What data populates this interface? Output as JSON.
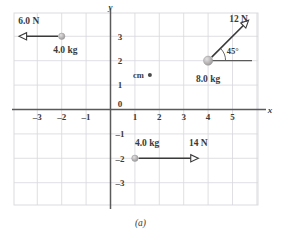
{
  "figure": {
    "caption": "(a)",
    "axes": {
      "x_axis_label": "x",
      "y_axis_label": "y",
      "x_ticks": [
        "-3",
        "-2",
        "-1",
        "1",
        "2",
        "3",
        "4",
        "5"
      ],
      "y_ticks": [
        "3",
        "2",
        "1",
        "-1",
        "-2",
        "-3"
      ],
      "origin_label": "0",
      "x_range": [
        -3.7,
        5.8
      ],
      "y_range": [
        -3.7,
        3.7
      ],
      "grid": true,
      "grid_color": "#d8d8dd",
      "axis_color": "#5a5a5a"
    },
    "center_of_mass": {
      "label": "cm",
      "x": 1.45,
      "y": 1.4,
      "marker": "dot"
    },
    "particles": [
      {
        "id": "particle-top-left",
        "mass_label": "4.0 kg",
        "x": -2.0,
        "y": 3.0,
        "radius": 3.2,
        "color": "#b0aeae",
        "force": {
          "magnitude_label": "6.0 N",
          "angle_deg": 180,
          "length": 1.75,
          "label_x": -3.35,
          "label_y": 3.62,
          "mass_label_x": -1.85,
          "mass_label_y": 2.45
        }
      },
      {
        "id": "particle-right",
        "mass_label": "8.0 kg",
        "x": 4.0,
        "y": 2.0,
        "radius": 4.6,
        "color": "#b0aeae",
        "force": {
          "magnitude_label": "12 N",
          "angle_deg": 45,
          "angle_label": "45°",
          "length": 2.35,
          "label_x": 5.25,
          "label_y": 3.72,
          "mass_label_x": 4.0,
          "mass_label_y": 1.25,
          "reference_line": true
        }
      },
      {
        "id": "particle-bottom",
        "mass_label": "4.0 kg",
        "x": 1.0,
        "y": -2.0,
        "radius": 3.2,
        "color": "#b0aeae",
        "force": {
          "magnitude_label": "14 N",
          "angle_deg": 0,
          "length": 2.6,
          "label_x": 3.6,
          "label_y": -1.35,
          "mass_label_x": 1.5,
          "mass_label_y": -1.38
        }
      }
    ],
    "colors": {
      "arrow": "#3a3a3a",
      "text": "#3a3a3a",
      "reference_line": "#5a5a5a"
    }
  }
}
